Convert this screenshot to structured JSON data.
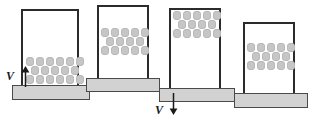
{
  "figure": {
    "background_color": "#ffffff",
    "vessel_stroke_color": "#2b2b2b",
    "plate_fill_color": "#d2d2d2",
    "plate_stroke_color": "#4a4a4a",
    "particle_fill_color": "#c6c6c6",
    "particle_stroke_color": "#b4b4b4",
    "annotation_color": "#1a1a1a"
  },
  "panels": [
    {
      "id": "panel-1",
      "name": "upstroke-bed-at-base",
      "phase_label": "1",
      "caption": "Plate moving upward; particles resting on vessel floor",
      "vessel": {
        "x": 21,
        "y": 9,
        "width": 58,
        "height": 76
      },
      "plate": {
        "x": 12,
        "y": 85,
        "width": 78,
        "height": 15
      },
      "bed": {
        "x": 26,
        "y": 57,
        "rows": [
          6,
          5,
          6
        ],
        "row_indent": [
          false,
          true,
          false
        ]
      },
      "velocity": {
        "present": true,
        "label": "V",
        "direction": "up",
        "label_x": 6,
        "label_y": 70,
        "arrow_x": 20,
        "arrow_y": 66,
        "arrow_length": 20
      }
    },
    {
      "id": "panel-2",
      "name": "flight-bed-midway",
      "phase_label": "2",
      "caption": "Vessel lifted; particle bed in free flight near mid-height",
      "vessel": {
        "x": 97,
        "y": 5,
        "width": 52,
        "height": 73
      },
      "plate": {
        "x": 86,
        "y": 78,
        "width": 74,
        "height": 14
      },
      "bed": {
        "x": 101,
        "y": 28,
        "rows": [
          5,
          4,
          5
        ],
        "row_indent": [
          false,
          true,
          false
        ]
      },
      "velocity": {
        "present": false,
        "label": "",
        "direction": "none"
      }
    },
    {
      "id": "panel-3",
      "name": "downstroke-bed-at-top",
      "phase_label": "3",
      "caption": "Plate moving downward; particle bed near vessel top",
      "vessel": {
        "x": 169,
        "y": 8,
        "width": 52,
        "height": 80
      },
      "plate": {
        "x": 159,
        "y": 88,
        "width": 76,
        "height": 14
      },
      "bed": {
        "x": 173,
        "y": 11,
        "rows": [
          5,
          4,
          5
        ],
        "row_indent": [
          false,
          true,
          false
        ]
      },
      "velocity": {
        "present": true,
        "label": "V",
        "direction": "down",
        "label_x": 155,
        "label_y": 104,
        "arrow_x": 168,
        "arrow_y": 92,
        "arrow_length": 22
      }
    },
    {
      "id": "panel-4",
      "name": "recontact-bed-midlow",
      "phase_label": "4",
      "caption": "Vessel descending; particle bed in lower-middle region",
      "vessel": {
        "x": 243,
        "y": 22,
        "width": 52,
        "height": 71
      },
      "plate": {
        "x": 234,
        "y": 93,
        "width": 74,
        "height": 15
      },
      "bed": {
        "x": 247,
        "y": 43,
        "rows": [
          5,
          4,
          5
        ],
        "row_indent": [
          false,
          true,
          false
        ]
      },
      "velocity": {
        "present": false,
        "label": "",
        "direction": "none"
      }
    }
  ]
}
